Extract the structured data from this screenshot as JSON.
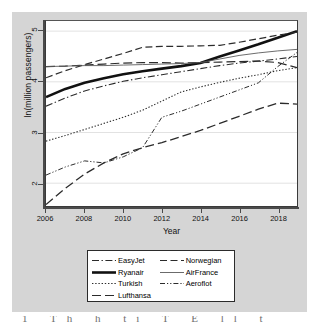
{
  "figure": {
    "background_color": "#d5d5d5",
    "plot_background_color": "#ffffff",
    "axis_color": "#4a4a4a",
    "caption_fragment": "1 Th h ti      T    E           ll    t"
  },
  "axes": {
    "y_title": "ln(million passengers)",
    "x_title": "Year",
    "y_ticks": [
      "2",
      "3",
      "4",
      "5"
    ],
    "x_ticks": [
      "2006",
      "2008",
      "2010",
      "2012",
      "2014",
      "2016",
      "2018"
    ]
  },
  "legend": {
    "rows": [
      {
        "left_label": "EasyJet",
        "right_label": "Norwegian"
      },
      {
        "left_label": "Ryanair",
        "right_label": "AirFrance"
      },
      {
        "left_label": "Turkish",
        "right_label": "Aeroflot"
      },
      {
        "left_label": "Lufthansa",
        "right_label": ""
      }
    ]
  },
  "chart_data": {
    "type": "line",
    "title": "",
    "xlabel": "Year",
    "ylabel": "ln(million passengers)",
    "xlim": [
      2006,
      2019
    ],
    "ylim": [
      1.55,
      5.2
    ],
    "yticks": [
      2,
      3,
      4,
      5
    ],
    "xticks": [
      2006,
      2008,
      2010,
      2012,
      2014,
      2016,
      2018
    ],
    "grid": "horizontal",
    "legend_position": "below-plot",
    "x": [
      2006,
      2007,
      2008,
      2009,
      2010,
      2011,
      2012,
      2013,
      2014,
      2015,
      2016,
      2017,
      2018,
      2019
    ],
    "series": [
      {
        "name": "EasyJet",
        "style": "dash-dot",
        "color": "#2b2b2b",
        "width": 1.1,
        "values": [
          3.52,
          3.68,
          3.82,
          3.92,
          4.01,
          4.08,
          4.14,
          4.2,
          4.26,
          4.32,
          4.37,
          4.41,
          4.45,
          4.5
        ]
      },
      {
        "name": "Ryanair",
        "style": "solid-thick",
        "color": "#111111",
        "width": 2.6,
        "values": [
          3.7,
          3.86,
          3.98,
          4.07,
          4.15,
          4.21,
          4.26,
          4.31,
          4.37,
          4.5,
          4.62,
          4.74,
          4.87,
          5.0
        ]
      },
      {
        "name": "Turkish",
        "style": "dotted",
        "color": "#2b2b2b",
        "width": 1.1,
        "values": [
          2.83,
          2.94,
          3.06,
          3.18,
          3.3,
          3.44,
          3.62,
          3.8,
          3.9,
          3.99,
          4.07,
          4.14,
          4.22,
          4.28
        ]
      },
      {
        "name": "Lufthansa",
        "style": "long-dash",
        "color": "#2b2b2b",
        "width": 1.2,
        "values": [
          4.3,
          4.31,
          4.33,
          4.35,
          4.37,
          4.38,
          4.38,
          4.37,
          4.38,
          4.39,
          4.4,
          4.41,
          4.38,
          4.28
        ]
      },
      {
        "name": "Norwegian",
        "style": "dash",
        "color": "#2b2b2b",
        "width": 1.2,
        "values": [
          4.08,
          4.22,
          4.34,
          4.45,
          4.56,
          4.68,
          4.7,
          4.7,
          4.71,
          4.72,
          4.78,
          4.85,
          4.92,
          4.98
        ]
      },
      {
        "name": "AirFrance",
        "style": "solid-thin",
        "color": "#5a5a5a",
        "width": 0.9,
        "values": [
          4.3,
          4.31,
          4.32,
          4.32,
          4.33,
          4.34,
          4.35,
          4.36,
          4.38,
          4.45,
          4.52,
          4.57,
          4.61,
          4.64
        ]
      },
      {
        "name": "Aeroflot",
        "style": "dash-dot-dot",
        "color": "#2b2b2b",
        "width": 1.0,
        "values": [
          2.16,
          2.32,
          2.44,
          2.4,
          2.52,
          2.7,
          3.3,
          3.42,
          3.56,
          3.7,
          3.84,
          3.98,
          4.3,
          4.58
        ]
      },
      {
        "name": "Lufthansa-lower",
        "style": "long-dash",
        "color": "#2b2b2b",
        "width": 1.3,
        "values": [
          1.58,
          1.9,
          2.18,
          2.4,
          2.58,
          2.7,
          2.8,
          2.92,
          3.04,
          3.18,
          3.32,
          3.46,
          3.58,
          3.56
        ]
      }
    ]
  }
}
